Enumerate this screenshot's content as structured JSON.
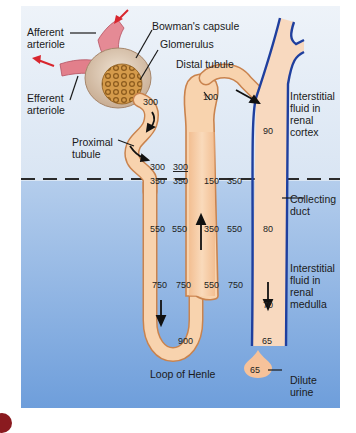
{
  "diagram": {
    "colors": {
      "cortex_bg": "#e4edf6",
      "medulla_bg_top": "#a9c6ea",
      "medulla_bg_bottom": "#6f9fdc",
      "tubule_fill": "#f6c9a0",
      "tubule_edge": "#c9834e",
      "duct_edge": "#1f3f9e",
      "arteriole": "#e07a86",
      "arrow_red": "#d8262e",
      "glomerulus": "#c98a3a",
      "corner_badge": "#8a1a1f"
    },
    "labels": {
      "afferent_arteriole": "Afferent\narteriole",
      "efferent_arteriole": "Efferent\narteriole",
      "bowmans_capsule": "Bowman's capsule",
      "glomerulus": "Glomerulus",
      "distal_tubule": "Distal tubule",
      "proximal_tubule": "Proximal\ntubule",
      "interstitial_cortex": "Interstitial\nfluid in\nrenal\ncortex",
      "collecting_duct": "Collecting\nduct",
      "interstitial_medulla": "Interstitial\nfluid in\nrenal\nmedulla",
      "loop_of_henle": "Loop of Henle",
      "dilute_urine": "Dilute\nurine"
    },
    "values": {
      "proximal_start": "300",
      "proximal_end": "300",
      "cortex_interstitial": "300",
      "desc_350": "350",
      "inter_350_left": "350",
      "desc_550": "550",
      "inter_550_left": "550",
      "desc_750": "750",
      "inter_750_left": "750",
      "loop_bottom": "900",
      "asc_550": "550",
      "inter_750_right": "750",
      "asc_350": "350",
      "inter_550_right": "550",
      "asc_150": "150",
      "inter_350_right": "350",
      "distal": "100",
      "duct_90": "90",
      "duct_80": "80",
      "duct_70": "70",
      "duct_65": "65",
      "urine": "65"
    }
  }
}
